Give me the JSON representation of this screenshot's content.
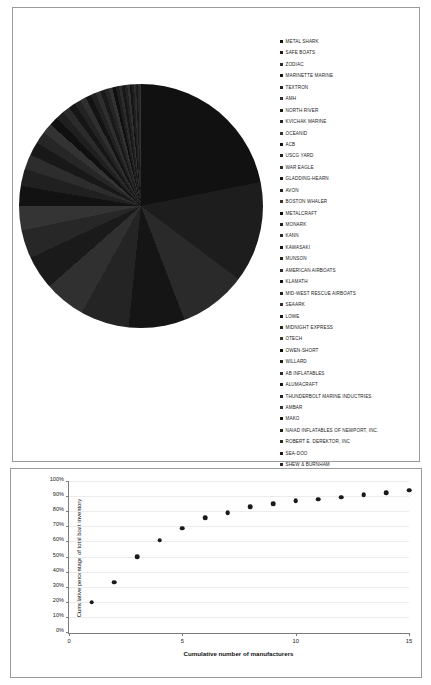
{
  "pie_panel": {
    "legend_title": "Boat manufacturers",
    "legend": [
      {
        "label": "METAL SHARK"
      },
      {
        "label": "SAFE BOATS"
      },
      {
        "label": "ZODIAC"
      },
      {
        "label": "MARINETTE MARINE"
      },
      {
        "label": "TEXTRON"
      },
      {
        "label": "AMH"
      },
      {
        "label": "NORTH RIVER"
      },
      {
        "label": "KVICHAK MARINE"
      },
      {
        "label": "OCEANID"
      },
      {
        "label": "ACB"
      },
      {
        "label": "USCG YARD"
      },
      {
        "label": "WAR EAGLE"
      },
      {
        "label": "GLADDING-HEARN"
      },
      {
        "label": "AVON"
      },
      {
        "label": "BOSTON WHALER"
      },
      {
        "label": "METALCRAFT"
      },
      {
        "label": "MONARK"
      },
      {
        "label": "KANN"
      },
      {
        "label": "KAWASAKI"
      },
      {
        "label": "MUNSON"
      },
      {
        "label": "AMERICAN AIRBOATS"
      },
      {
        "label": "KLAMATH"
      },
      {
        "label": "MID-WEST RESCUE AIRBOATS"
      },
      {
        "label": "SEAARK"
      },
      {
        "label": "LOWE"
      },
      {
        "label": "MIDNIGHT EXPRESS"
      },
      {
        "label": "OTECH"
      },
      {
        "label": "OWEN-SHORT"
      },
      {
        "label": "WILLARD"
      },
      {
        "label": "AB INFLATABLES"
      },
      {
        "label": "ALUMACRAFT"
      },
      {
        "label": "THUNDERBOLT MARINE INDUCTRIES"
      },
      {
        "label": "AMBAR"
      },
      {
        "label": "MAKO"
      },
      {
        "label": "NAIAD INFLATABLES OF NEWPORT, INC."
      },
      {
        "label": "ROBERT E. DEREKTOR, INC"
      },
      {
        "label": "SEA-DOO"
      },
      {
        "label": "SHEW & BURNHAM"
      },
      {
        "label": "STARCRAFT"
      }
    ]
  },
  "chart_data": [
    {
      "type": "pie",
      "title": "",
      "legend_position": "right",
      "categories": [
        "METAL SHARK",
        "SAFE BOATS",
        "ZODIAC",
        "MARINETTE MARINE",
        "TEXTRON",
        "AMH",
        "NORTH RIVER",
        "KVICHAK MARINE",
        "OCEANID",
        "ACB",
        "USCG YARD",
        "WAR EAGLE",
        "GLADDING-HEARN",
        "AVON",
        "BOSTON WHALER",
        "METALCRAFT",
        "MONARK",
        "KANN",
        "KAWASAKI",
        "MUNSON",
        "AMERICAN AIRBOATS",
        "KLAMATH",
        "MID-WEST RESCUE AIRBOATS",
        "SEAARK",
        "LOWE",
        "MIDNIGHT EXPRESS",
        "OTECH",
        "OWEN-SHORT",
        "WILLARD",
        "AB INFLATABLES",
        "ALUMACRAFT",
        "THUNDERBOLT MARINE INDUCTRIES",
        "AMBAR",
        "MAKO",
        "NAIAD INFLATABLES OF NEWPORT, INC.",
        "ROBERT E. DEREKTOR, INC",
        "SEA-DOO",
        "SHEW & BURNHAM",
        "STARCRAFT"
      ],
      "values": [
        22.0,
        13.5,
        9.0,
        7.5,
        6.5,
        5.5,
        4.5,
        3.8,
        3.2,
        2.7,
        2.3,
        2.0,
        1.8,
        1.6,
        1.4,
        1.2,
        1.1,
        1.0,
        0.9,
        0.85,
        0.8,
        0.75,
        0.7,
        0.65,
        0.6,
        0.55,
        0.5,
        0.45,
        0.42,
        0.4,
        0.38,
        0.35,
        0.32,
        0.3,
        0.28,
        0.26,
        0.24,
        0.22,
        0.2
      ],
      "unit": "%",
      "colors": [
        "#111111",
        "#1d1d1d",
        "#2a2a2a",
        "#151515",
        "#242424",
        "#303030",
        "#1a1a1a",
        "#272727",
        "#343434",
        "#121212",
        "#202020",
        "#2d2d2d",
        "#181818",
        "#262626",
        "#333333",
        "#101010",
        "#1f1f1f",
        "#2b2b2b",
        "#161616",
        "#232323",
        "#2f2f2f",
        "#131313",
        "#212121",
        "#2e2e2e",
        "#191919",
        "#252525",
        "#323232",
        "#0f0f0f",
        "#1e1e1e",
        "#2c2c2c",
        "#171717",
        "#222222",
        "#313131",
        "#141414",
        "#202020",
        "#2d2d2d",
        "#1b1b1b",
        "#282828",
        "#353535"
      ]
    },
    {
      "type": "scatter",
      "title": "",
      "xlabel": "Cumulative number of manufacturers",
      "ylabel": "Cumulative percentage of total boat inventory",
      "xlim": [
        0,
        15
      ],
      "ylim": [
        0,
        100
      ],
      "grid": true,
      "xticks": [
        0,
        5,
        10,
        15
      ],
      "xtick_labels": [
        "0",
        "5",
        "10",
        "15"
      ],
      "yticks": [
        0,
        10,
        20,
        30,
        40,
        50,
        60,
        70,
        80,
        90,
        100
      ],
      "ytick_labels": [
        "0%",
        "10%",
        "20%",
        "30%",
        "40%",
        "50%",
        "60%",
        "70%",
        "80%",
        "90%",
        "100%"
      ],
      "x": [
        1,
        2,
        3,
        4,
        5,
        6,
        7,
        8,
        9,
        10,
        11,
        12,
        13,
        14,
        15
      ],
      "y": [
        22,
        35,
        52,
        63,
        71,
        78,
        81,
        85,
        87,
        89,
        90,
        91.5,
        93,
        94.5,
        96
      ]
    }
  ]
}
